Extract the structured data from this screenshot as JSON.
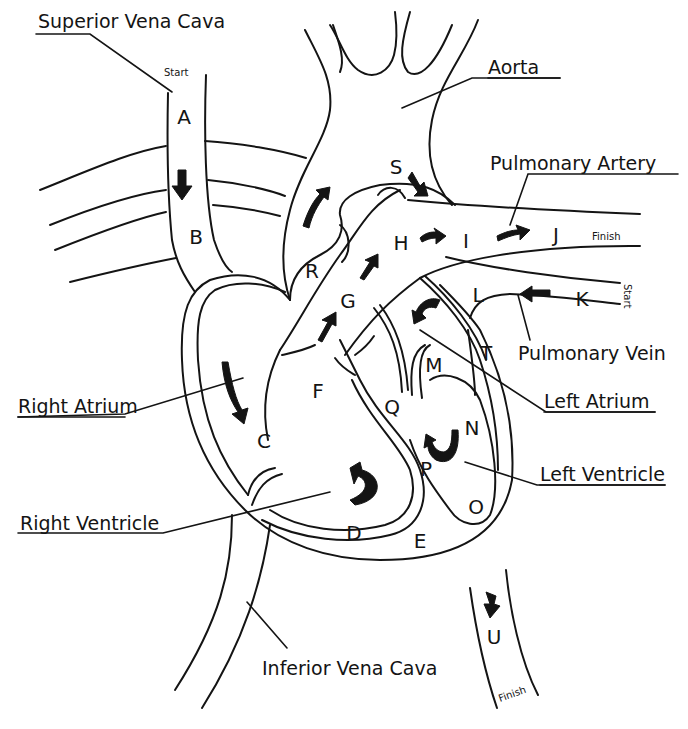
{
  "diagram": {
    "labels": {
      "superior_vena_cava": "Superior Vena Cava",
      "aorta": "Aorta",
      "pulmonary_artery": "Pulmonary Artery",
      "pulmonary_vein": "Pulmonary Vein",
      "left_atrium": "Left Atrium",
      "left_ventricle": "Left Ventricle",
      "right_atrium": "Right Atrium",
      "right_ventricle": "Right Ventricle",
      "inferior_vena_cava": "Inferior Vena Cava"
    },
    "markers": {
      "start_top": "Start",
      "start_right": "Start",
      "finish_right": "Finish",
      "finish_bottom": "Finish"
    },
    "letters": {
      "A": "A",
      "B": "B",
      "C": "C",
      "D": "D",
      "E": "E",
      "F": "F",
      "G": "G",
      "H": "H",
      "I": "I",
      "J": "J",
      "K": "K",
      "L": "L",
      "M": "M",
      "N": "N",
      "O": "O",
      "P": "P",
      "Q": "Q",
      "R": "R",
      "S": "S",
      "T": "T",
      "U": "U"
    },
    "stroke_color": "#141414",
    "background": "#ffffff"
  }
}
